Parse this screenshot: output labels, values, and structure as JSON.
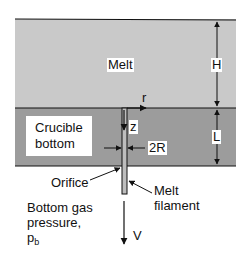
{
  "diagram": {
    "colors": {
      "melt": "#c9c9c9",
      "crucible": "#9c9c9c",
      "line": "#111111",
      "filament": "#bdbdbd",
      "background": "#ffffff"
    },
    "labels": {
      "melt": "Melt",
      "H": "H",
      "r": "r",
      "z": "z",
      "crucible_line1": "Crucible",
      "crucible_line2": "bottom",
      "two_r": "2R",
      "L": "L",
      "orifice": "Orifice",
      "filament_line1": "Melt",
      "filament_line2": "filament",
      "gas_line1": "Bottom gas",
      "gas_line2": "pressure,",
      "gas_symbol": "p",
      "gas_subscript": "b",
      "V": "V"
    }
  }
}
